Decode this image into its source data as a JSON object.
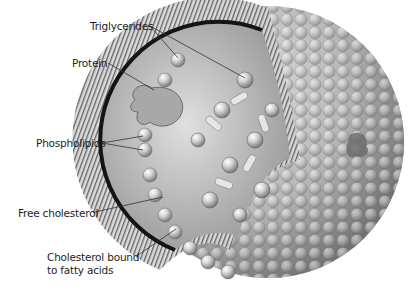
{
  "diagram": {
    "labels": {
      "triglycerides": "Triglycerides",
      "protein": "Protein",
      "phospholipids": "Phospholipids",
      "free_cholesterol": "Free cholesterol",
      "cholesterol_bound_line1": "Cholesterol bound",
      "cholesterol_bound_line2": "to fatty acids"
    },
    "colors": {
      "background": "#ffffff",
      "sphere_light": "#e6e6e6",
      "sphere_mid": "#b4b4b4",
      "sphere_dark": "#6e6e6e",
      "core_boundary": "#141414",
      "leader_line": "#333333",
      "text": "#1e1e1e"
    }
  }
}
